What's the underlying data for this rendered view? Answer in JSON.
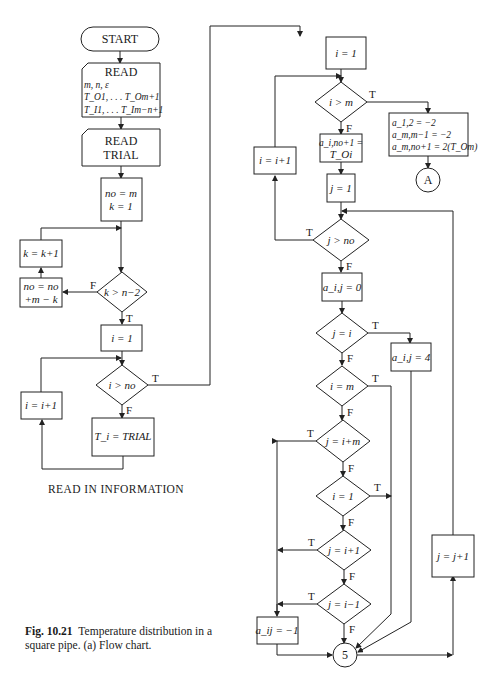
{
  "figure": {
    "number": "Fig. 10.21",
    "caption": "Temperature distribution in a square pipe.  (a) Flow chart.",
    "section_title": "READ IN INFORMATION"
  },
  "left_column": {
    "start": "START",
    "read1": {
      "title": "READ",
      "line1": "m, n, ε",
      "line2": "T_O1, . . . T_Om+1",
      "line3": "T_I1, . . . T_Im−n+1"
    },
    "read2": {
      "line1": "READ",
      "line2": "TRIAL"
    },
    "init": {
      "line1": "no = m",
      "line2": "k = 1"
    },
    "k_increment": "k = k+1",
    "no_update": {
      "line1": "no = no",
      "line2": "+m − k"
    },
    "decision_k": "k > n−2",
    "i_init": "i = 1",
    "decision_i_no": "i > no",
    "i_increment": "i = i+1",
    "assign_trial": "T_i = TRIAL"
  },
  "right_column": {
    "i_init": "i = 1",
    "decision_i_m": "i > m",
    "i_increment": "i = i+1",
    "assign_a_no": {
      "line1": "a_i,no+1 =",
      "line2": "T_Oi"
    },
    "boundary_block": {
      "line1": "a_1,2 = −2",
      "line2": "a_m,m−1 = −2",
      "line3": "a_m,no+1 = 2(T_Om)"
    },
    "connector_a": "A",
    "j_init": "j = 1",
    "decision_j_no": "j > no",
    "assign_zero": "a_i,j = 0",
    "decision_j_i": "j = i",
    "assign_four": "a_i,j = 4",
    "decision_i_m_eq": "i = m",
    "decision_j_im": "j = i+m",
    "decision_i_1": "i = 1",
    "decision_j_ip1": "j = i+1",
    "decision_j_im1": "j = i−1",
    "assign_minus1": "a_ij = −1",
    "connector_5": "5",
    "j_increment": "j = j+1"
  },
  "branch_labels": {
    "true": "T",
    "false": "F"
  }
}
